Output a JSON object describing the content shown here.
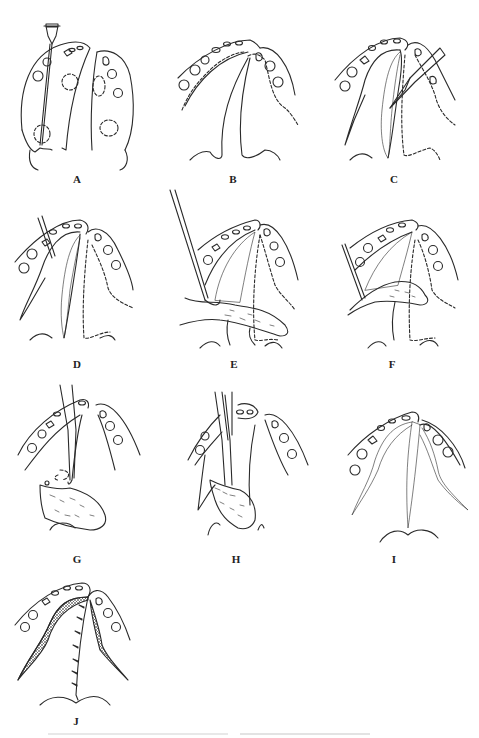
{
  "figure": {
    "type": "surgical-illustration-sequence",
    "panels": [
      {
        "id": "A",
        "label": "A",
        "content": "syringe needle injecting into palatal mucosa; dotted infiltration zones"
      },
      {
        "id": "B",
        "label": "B",
        "content": "cleft palate outline with dashed incision lines"
      },
      {
        "id": "C",
        "label": "C",
        "content": "scalpel making incision along cleft margin"
      },
      {
        "id": "D",
        "label": "D",
        "content": "instrument elevating mucoperiosteal flap"
      },
      {
        "id": "E",
        "label": "E",
        "content": "elevator lifting flap; flap reflected"
      },
      {
        "id": "F",
        "label": "F",
        "content": "flap reflected with instrument, contralateral side dashed"
      },
      {
        "id": "G",
        "label": "G",
        "content": "instruments dissecting with flaps retracted"
      },
      {
        "id": "H",
        "label": "H",
        "content": "forceps and scissors dissecting nasal layer"
      },
      {
        "id": "I",
        "label": "I",
        "content": "flaps approximated at midline"
      },
      {
        "id": "J",
        "label": "J",
        "content": "midline sutured closure with hatched lateral relaxing areas"
      }
    ],
    "caption": ""
  }
}
